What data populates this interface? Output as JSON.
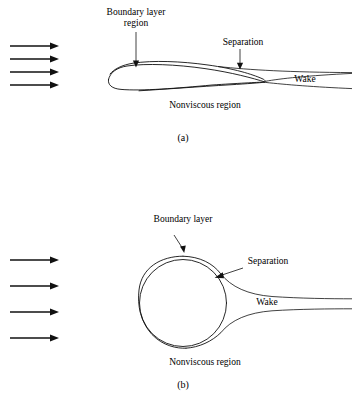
{
  "figure": {
    "background_color": "#ffffff",
    "line_color": "#111111",
    "panels": [
      {
        "id": "a",
        "caption": "(a)",
        "body_shape": "airfoil",
        "labels": {
          "boundary_layer_line1": "Boundary layer",
          "boundary_layer_line2": "region",
          "separation": "Separation",
          "wake": "Wake",
          "nonviscous": "Nonviscous region"
        },
        "flow_arrows": {
          "count": 4,
          "direction": "right",
          "x_start": 10,
          "x_end": 58,
          "y_values": [
            46,
            59,
            72,
            85
          ]
        }
      },
      {
        "id": "b",
        "caption": "(b)",
        "body_shape": "circle",
        "labels": {
          "boundary_layer": "Boundary layer",
          "separation": "Separation",
          "wake": "Wake",
          "nonviscous": "Nonviscous region"
        },
        "flow_arrows": {
          "count": 4,
          "direction": "right",
          "x_start": 10,
          "x_end": 58,
          "y_values": [
            260,
            286,
            312,
            338
          ]
        }
      }
    ]
  }
}
